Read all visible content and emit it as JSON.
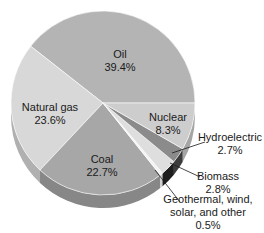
{
  "chart_data": {
    "type": "pie",
    "style": "3d-tilted",
    "title": "",
    "slices": [
      {
        "label": "Oil",
        "value": 39.4,
        "value_text": "39.4%",
        "color": "#b4b4b4",
        "side": "#8f8f8f"
      },
      {
        "label": "Natural gas",
        "value": 23.6,
        "value_text": "23.6%",
        "color": "#d8d8d8",
        "side": "#b0b0b0"
      },
      {
        "label": "Coal",
        "value": 22.7,
        "value_text": "22.7%",
        "color": "#a7a7a7",
        "side": "#878787"
      },
      {
        "label": "Geothermal, wind, solar, and other",
        "value": 0.5,
        "value_text": "0.5%",
        "color": "#f4f4f4",
        "side": "#d0d0d0"
      },
      {
        "label": "Biomass",
        "value": 2.8,
        "value_text": "2.8%",
        "color": "#dedede",
        "side": "#1e1e1e"
      },
      {
        "label": "Hydroelectric",
        "value": 2.7,
        "value_text": "2.7%",
        "color": "#8b8b8b",
        "side": "#3c3c3c"
      },
      {
        "label": "Nuclear",
        "value": 8.3,
        "value_text": "8.3%",
        "color": "#cdcdcd",
        "side": "#a5a5a5"
      }
    ]
  },
  "labels": {
    "oil": {
      "name": "Oil",
      "pct": "39.4%"
    },
    "natural_gas": {
      "name": "Natural gas",
      "pct": "23.6%"
    },
    "coal": {
      "name": "Coal",
      "pct": "22.7%"
    },
    "nuclear": {
      "name": "Nuclear",
      "pct": "8.3%"
    },
    "hydro": {
      "name": "Hydroelectric",
      "pct": "2.7%"
    },
    "biomass": {
      "name": "Biomass",
      "pct": "2.8%"
    },
    "geo": {
      "line1": "Geothermal, wind,",
      "line2": "solar, and other",
      "pct": "0.5%"
    }
  }
}
